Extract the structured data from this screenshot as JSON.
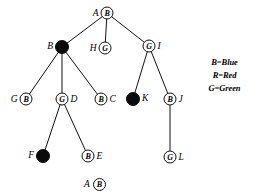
{
  "diagram": {
    "nodes": [
      {
        "id": "A",
        "label": "A",
        "color_code": "B",
        "filled": false,
        "label_side": "left",
        "x": 107,
        "y": 13
      },
      {
        "id": "B",
        "label": "B",
        "color_code": "",
        "filled": true,
        "label_side": "left",
        "x": 62,
        "y": 47
      },
      {
        "id": "H",
        "label": "H",
        "color_code": "G",
        "filled": false,
        "label_side": "left",
        "x": 105,
        "y": 48
      },
      {
        "id": "I",
        "label": "I",
        "color_code": "G",
        "filled": false,
        "label_side": "right",
        "x": 149,
        "y": 46
      },
      {
        "id": "G",
        "label": "G",
        "color_code": "B",
        "filled": false,
        "label_side": "left",
        "x": 26,
        "y": 99
      },
      {
        "id": "D",
        "label": "D",
        "color_code": "G",
        "filled": false,
        "label_side": "right",
        "x": 62,
        "y": 99
      },
      {
        "id": "C",
        "label": "C",
        "color_code": "B",
        "filled": false,
        "label_side": "right",
        "x": 101,
        "y": 99
      },
      {
        "id": "K",
        "label": "K",
        "color_code": "",
        "filled": true,
        "label_side": "right",
        "x": 133,
        "y": 99
      },
      {
        "id": "J",
        "label": "J",
        "color_code": "B",
        "filled": false,
        "label_side": "right",
        "x": 170,
        "y": 99
      },
      {
        "id": "F",
        "label": "F",
        "color_code": "",
        "filled": true,
        "label_side": "left",
        "x": 43,
        "y": 156
      },
      {
        "id": "E",
        "label": "E",
        "color_code": "B",
        "filled": false,
        "label_side": "right",
        "x": 88,
        "y": 156
      },
      {
        "id": "L",
        "label": "L",
        "color_code": "G",
        "filled": false,
        "label_side": "right",
        "x": 170,
        "y": 157
      }
    ],
    "edges": [
      {
        "from": "A",
        "to": "B"
      },
      {
        "from": "A",
        "to": "H"
      },
      {
        "from": "A",
        "to": "I"
      },
      {
        "from": "B",
        "to": "G"
      },
      {
        "from": "B",
        "to": "D"
      },
      {
        "from": "B",
        "to": "C"
      },
      {
        "from": "D",
        "to": "F"
      },
      {
        "from": "D",
        "to": "E"
      },
      {
        "from": "I",
        "to": "K"
      },
      {
        "from": "I",
        "to": "J"
      },
      {
        "from": "J",
        "to": "L"
      }
    ]
  },
  "legend": {
    "lines": [
      "B=Blue",
      "R=Red",
      "G=Green"
    ]
  },
  "footer": {
    "label": "A",
    "color_code": "B"
  },
  "colors": {
    "stroke": "#111111",
    "fill_black": "#0a0a0a",
    "background": "#ffffff"
  }
}
